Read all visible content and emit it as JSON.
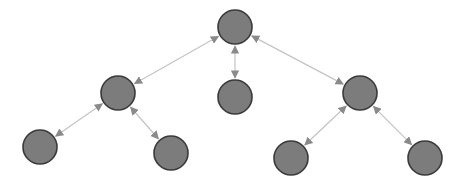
{
  "diagram": {
    "type": "tree",
    "width": 472,
    "height": 187,
    "colors": {
      "node_fill": "#7c7c7c",
      "node_stroke": "#3a3a3a",
      "edge": "#c4c4c4",
      "arrowhead": "#8a8a8a",
      "background": "#ffffff"
    },
    "node_radius": 17,
    "nodes": [
      {
        "id": "root",
        "level": 0,
        "x": 235,
        "y": 27
      },
      {
        "id": "l1-left",
        "level": 1,
        "x": 118,
        "y": 93
      },
      {
        "id": "l1-middle",
        "level": 1,
        "x": 235,
        "y": 97
      },
      {
        "id": "l1-right",
        "level": 1,
        "x": 360,
        "y": 93
      },
      {
        "id": "l2-left-left",
        "level": 2,
        "x": 40,
        "y": 147
      },
      {
        "id": "l2-left-right",
        "level": 2,
        "x": 171,
        "y": 153
      },
      {
        "id": "l2-right-left",
        "level": 2,
        "x": 291,
        "y": 158
      },
      {
        "id": "l2-right-right",
        "level": 2,
        "x": 425,
        "y": 158
      }
    ],
    "edges": [
      {
        "from": "root",
        "to": "l1-left",
        "direction": "both"
      },
      {
        "from": "root",
        "to": "l1-middle",
        "direction": "both"
      },
      {
        "from": "root",
        "to": "l1-right",
        "direction": "both"
      },
      {
        "from": "l1-left",
        "to": "l2-left-left",
        "direction": "both"
      },
      {
        "from": "l1-left",
        "to": "l2-left-right",
        "direction": "both"
      },
      {
        "from": "l1-right",
        "to": "l2-right-left",
        "direction": "both"
      },
      {
        "from": "l1-right",
        "to": "l2-right-right",
        "direction": "both"
      }
    ]
  }
}
